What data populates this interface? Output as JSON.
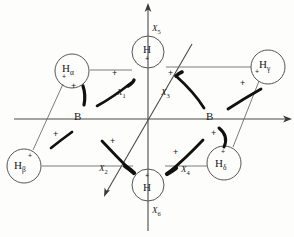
{
  "figure": {
    "background_color": "#fdfdfb",
    "line_color": "#3a3a3a",
    "arc_color": "#111111"
  },
  "axes": [
    {
      "name": "x5-axis",
      "label": "X",
      "sub": "5",
      "direction": "up",
      "label_x": 152,
      "label_y": 27
    },
    {
      "name": "x6-axis",
      "label": "X",
      "sub": "6",
      "direction": "down",
      "label_x": 152,
      "label_y": 211
    },
    {
      "name": "horizontal-axis",
      "label": "",
      "sub": "",
      "direction": "right"
    },
    {
      "name": "diagonal-axis",
      "label": "",
      "sub": "",
      "direction": "diagonal"
    }
  ],
  "atoms": [
    {
      "name": "boron-left",
      "label": "B",
      "sub": "",
      "charge": "",
      "cx": 80,
      "cy": 119,
      "r": 0,
      "x": 75,
      "y": 112
    },
    {
      "name": "boron-right",
      "label": "B",
      "sub": "",
      "charge": "",
      "cx": 212,
      "cy": 119,
      "r": 0,
      "x": 207,
      "y": 112
    },
    {
      "name": "hydrogen-top",
      "label": "H",
      "sub": "",
      "charge": "+",
      "cx": 148,
      "cy": 52,
      "r": 16,
      "x": 143,
      "y": 45
    },
    {
      "name": "hydrogen-bottom",
      "label": "H",
      "sub": "",
      "charge": "+",
      "cx": 148,
      "cy": 185,
      "r": 16,
      "x": 143,
      "y": 180
    },
    {
      "name": "hydrogen-alpha",
      "label": "H",
      "sub": "α",
      "charge": "+",
      "cx": 72,
      "cy": 71,
      "r": 17,
      "x": 62,
      "y": 63
    },
    {
      "name": "hydrogen-gamma",
      "label": "H",
      "sub": "γ",
      "charge": "+",
      "cx": 268,
      "cy": 67,
      "r": 17,
      "x": 258,
      "y": 59
    },
    {
      "name": "hydrogen-beta",
      "label": "H",
      "sub": "β",
      "charge": "+",
      "cx": 24,
      "cy": 166,
      "r": 17,
      "x": 14,
      "y": 159
    },
    {
      "name": "hydrogen-delta",
      "label": "H",
      "sub": "δ",
      "charge": "+",
      "cx": 224,
      "cy": 163,
      "r": 17,
      "x": 214,
      "y": 156
    }
  ],
  "coordinates": [
    {
      "name": "coord-x1",
      "label": "X",
      "sub": "1",
      "x": 117,
      "y": 92
    },
    {
      "name": "coord-x2",
      "label": "X",
      "sub": "2",
      "x": 101,
      "y": 167
    },
    {
      "name": "coord-x3",
      "label": "X",
      "sub": "3",
      "x": 163,
      "y": 92
    },
    {
      "name": "coord-x4",
      "label": "X",
      "sub": "4",
      "x": 183,
      "y": 168
    },
    {
      "name": "coord-x5",
      "label": "X",
      "sub": "5",
      "x": 152,
      "y": 27
    },
    {
      "name": "coord-x6",
      "label": "X",
      "sub": "6",
      "x": 152,
      "y": 209
    }
  ],
  "signs": [
    {
      "name": "plus-sign-x1",
      "symbol": "+",
      "x": 114,
      "y": 73
    },
    {
      "name": "plus-sign-x3",
      "symbol": "+",
      "x": 169,
      "y": 73
    },
    {
      "name": "plus-sign-alpha-1",
      "symbol": "+",
      "x": 72,
      "y": 86
    },
    {
      "name": "plus-sign-gamma",
      "symbol": "+",
      "x": 241,
      "y": 83
    },
    {
      "name": "plus-sign-beta",
      "symbol": "+",
      "x": 54,
      "y": 134
    },
    {
      "name": "plus-sign-x2",
      "symbol": "+",
      "x": 111,
      "y": 141
    },
    {
      "name": "plus-sign-x4",
      "symbol": "+",
      "x": 174,
      "y": 152
    },
    {
      "name": "plus-sign-delta",
      "symbol": "+",
      "x": 212,
      "y": 133
    }
  ],
  "bonds": [
    {
      "name": "bond-halpha-htop",
      "x1": 89,
      "y1": 70,
      "x2": 132,
      "y2": 70
    },
    {
      "name": "bond-htop-hgamma",
      "x1": 165,
      "y1": 67,
      "x2": 251,
      "y2": 67
    },
    {
      "name": "bond-hbeta-hbottom",
      "x1": 41,
      "y1": 166,
      "x2": 132,
      "y2": 166
    },
    {
      "name": "bond-hbottom-hdelta",
      "x1": 165,
      "y1": 166,
      "x2": 207,
      "y2": 166
    },
    {
      "name": "bond-halpha-hbeta",
      "x1": 63,
      "y1": 85,
      "x2": 33,
      "y2": 151
    },
    {
      "name": "bond-hgamma-hdelta",
      "x1": 259,
      "y1": 81,
      "x2": 232,
      "y2": 148
    }
  ],
  "arcs": [
    {
      "name": "arc-x1",
      "desc": "thick curved displacement arc, X1 region"
    },
    {
      "name": "arc-x2",
      "desc": "thick curved displacement arc, X2 region"
    },
    {
      "name": "arc-x3",
      "desc": "thick curved displacement arc, X3 region"
    },
    {
      "name": "arc-x4",
      "desc": "thick curved displacement arc, X4 region"
    },
    {
      "name": "arc-alpha",
      "desc": "thick vertical arc near H alpha"
    },
    {
      "name": "arc-gamma",
      "desc": "thick curved arc near H gamma"
    },
    {
      "name": "arc-beta",
      "desc": "thick curved arc near H beta"
    },
    {
      "name": "arc-delta",
      "desc": "thick curved arc near H delta"
    }
  ]
}
